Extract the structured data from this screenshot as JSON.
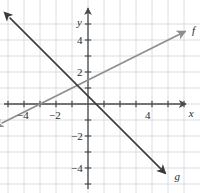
{
  "figure": {
    "type": "line-graph",
    "background": "#ffffff",
    "grid_color": "#d8dde2",
    "axis_color": "#4a4a4a",
    "origin_px": [
      88,
      104
    ],
    "unit_px": 16,
    "x_range": [
      -5.5,
      6.6
    ],
    "y_range": [
      -5.3,
      5.3
    ]
  },
  "axes": {
    "x_label": "x",
    "y_label": "y",
    "x_tick_labels": [
      {
        "value": -4,
        "text": "−4"
      },
      {
        "value": -2,
        "text": "−2"
      },
      {
        "value": 4,
        "text": "4"
      }
    ],
    "y_tick_labels": [
      {
        "value": 4,
        "text": "4"
      },
      {
        "value": 2,
        "text": "2"
      },
      {
        "value": -2,
        "text": "−2"
      },
      {
        "value": -4,
        "text": "−4"
      }
    ]
  },
  "chart_data": {
    "type": "line",
    "title": "",
    "xlabel": "x",
    "ylabel": "y",
    "xlim": [
      -5.5,
      6.6
    ],
    "ylim": [
      -5.3,
      5.3
    ],
    "grid": true,
    "legend": "inline-end-labels",
    "series": [
      {
        "name": "f",
        "label": "f",
        "color": "#8c8c8c",
        "slope": 0.5,
        "intercept": 1.5,
        "arrows": "both",
        "points": [
          [
            -5.4,
            -1.2
          ],
          [
            6.1,
            4.55
          ]
        ],
        "label_pos": [
          6.5,
          4.6
        ]
      },
      {
        "name": "g",
        "label": "g",
        "color": "#3a3a3a",
        "slope": -1.0,
        "intercept": 0.5,
        "arrows": "both",
        "points": [
          [
            -4.9,
            5.4
          ],
          [
            4.85,
            -4.35
          ]
        ],
        "label_pos": [
          5.4,
          -4.5
        ]
      }
    ]
  }
}
